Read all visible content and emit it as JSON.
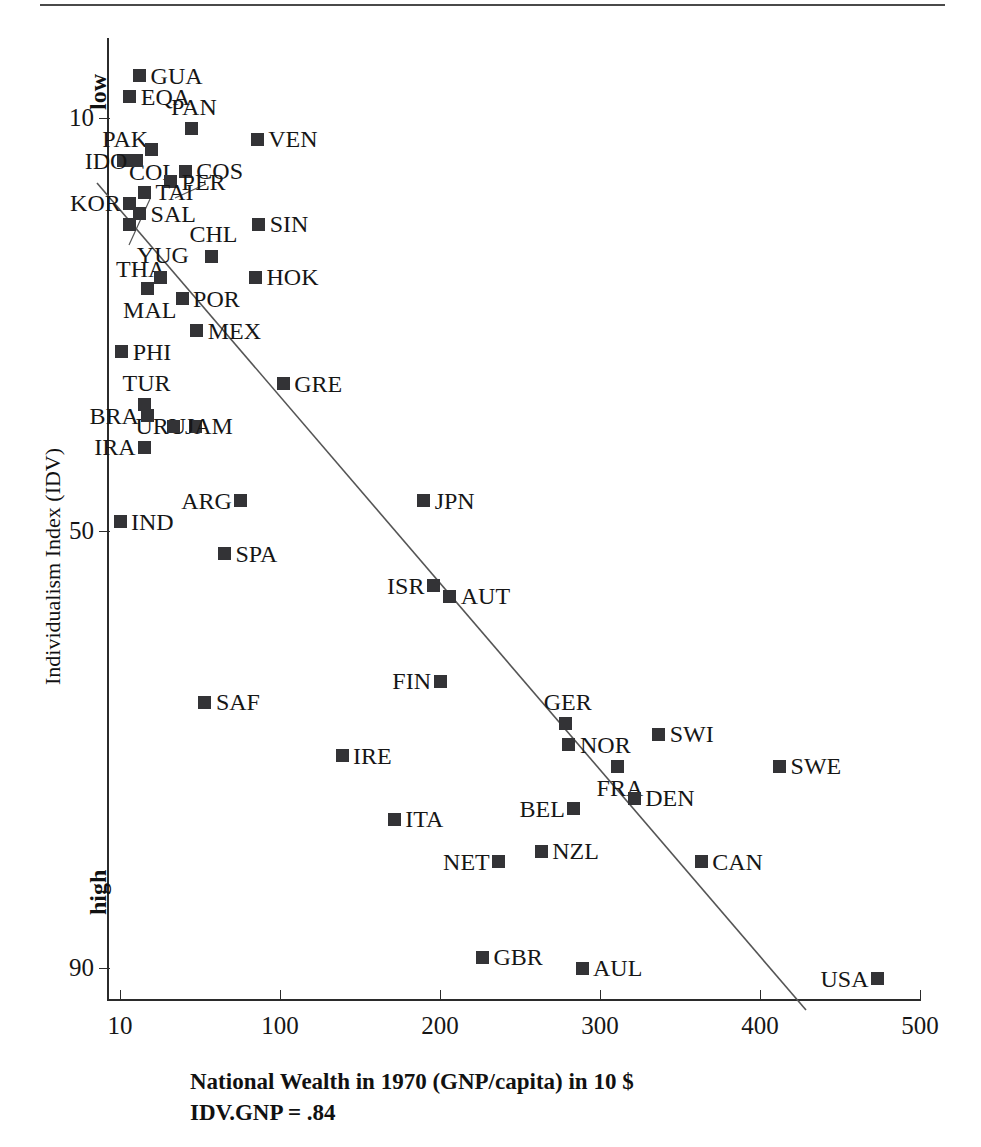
{
  "figure": {
    "xaxis_title_line1": "National Wealth in 1970 (GNP/capita) in 10 $",
    "xaxis_title_line2": "IDV.GNP = .84",
    "yaxis_title": "Individualism Index (IDV)",
    "y_low_label": "low",
    "y_high_label": "high",
    "marker_color": "#333336",
    "axis_color": "#2b2b2b",
    "line_color": "#555555"
  },
  "chart_data": {
    "type": "scatter",
    "title": "",
    "xlabel": "National Wealth in 1970 (GNP/capita) in 10 $",
    "ylabel": "Individualism Index (IDV)",
    "xlim": [
      0,
      520
    ],
    "ylim": [
      4,
      94
    ],
    "y_inverted": true,
    "grid": false,
    "legend": "none",
    "annotations": [
      "IDV.GNP = .84",
      "low",
      "high"
    ],
    "xticks": [
      10,
      100,
      200,
      300,
      400,
      500
    ],
    "yticks": [
      10,
      50,
      90
    ],
    "regression_line": {
      "x1": 12,
      "y1": 4.5,
      "x2": 427,
      "y2": 91.5,
      "correlation": 0.84
    },
    "points": [
      {
        "code": "GUA",
        "x": 22,
        "y": 6,
        "label_side": "right"
      },
      {
        "code": "EQA",
        "x": 16,
        "y": 8,
        "label_side": "right"
      },
      {
        "code": "PAN",
        "x": 54,
        "y": 11,
        "label_side": "above"
      },
      {
        "code": "VEN",
        "x": 94,
        "y": 12,
        "label_side": "right"
      },
      {
        "code": "PAK",
        "x": 12,
        "y": 14,
        "label_side": "above"
      },
      {
        "code": "COL",
        "x": 29,
        "y": 13,
        "label_side": "below"
      },
      {
        "code": "COS",
        "x": 50,
        "y": 15,
        "label_side": "right"
      },
      {
        "code": "IDO",
        "x": 20,
        "y": 14,
        "label_side": "left"
      },
      {
        "code": "PER",
        "x": 41,
        "y": 16,
        "label_side": "right"
      },
      {
        "code": "TAI",
        "x": 25,
        "y": 17,
        "label_side": "right"
      },
      {
        "code": "KOR",
        "x": 16,
        "y": 18,
        "label_side": "left"
      },
      {
        "code": "SIN",
        "x": 95,
        "y": 20,
        "label_side": "right"
      },
      {
        "code": "SAL",
        "x": 22,
        "y": 19,
        "label_side": "right"
      },
      {
        "code": "CHL",
        "x": 66,
        "y": 23,
        "label_side": "above"
      },
      {
        "code": "THA",
        "x": 16,
        "y": 20,
        "label_side": "leader"
      },
      {
        "code": "HOK",
        "x": 93,
        "y": 25,
        "label_side": "right"
      },
      {
        "code": "YUG",
        "x": 35,
        "y": 25,
        "label_side": "above"
      },
      {
        "code": "POR",
        "x": 48,
        "y": 27,
        "label_side": "right"
      },
      {
        "code": "MAL",
        "x": 27,
        "y": 26,
        "label_side": "below"
      },
      {
        "code": "MEX",
        "x": 57,
        "y": 30,
        "label_side": "right"
      },
      {
        "code": "PHI",
        "x": 11,
        "y": 32,
        "label_side": "right"
      },
      {
        "code": "GRE",
        "x": 110,
        "y": 35,
        "label_side": "right"
      },
      {
        "code": "TUR",
        "x": 25,
        "y": 37,
        "label_side": "above"
      },
      {
        "code": "URU",
        "x": 56,
        "y": 39,
        "label_side": "left"
      },
      {
        "code": "BRA",
        "x": 27,
        "y": 38,
        "label_side": "left"
      },
      {
        "code": "JAM",
        "x": 43,
        "y": 39,
        "label_side": "right"
      },
      {
        "code": "IRA",
        "x": 25,
        "y": 41,
        "label_side": "left"
      },
      {
        "code": "ARG",
        "x": 84,
        "y": 46,
        "label_side": "left"
      },
      {
        "code": "JPN",
        "x": 196,
        "y": 46,
        "label_side": "right"
      },
      {
        "code": "IND",
        "x": 10,
        "y": 48,
        "label_side": "right"
      },
      {
        "code": "SPA",
        "x": 74,
        "y": 51,
        "label_side": "right"
      },
      {
        "code": "ISR",
        "x": 202,
        "y": 54,
        "label_side": "left"
      },
      {
        "code": "AUT",
        "x": 212,
        "y": 55,
        "label_side": "right"
      },
      {
        "code": "FIN",
        "x": 206,
        "y": 63,
        "label_side": "left"
      },
      {
        "code": "SAF",
        "x": 62,
        "y": 65,
        "label_side": "right"
      },
      {
        "code": "GER",
        "x": 283,
        "y": 67,
        "label_side": "above"
      },
      {
        "code": "NOR",
        "x": 285,
        "y": 69,
        "label_side": "right"
      },
      {
        "code": "SWI",
        "x": 340,
        "y": 68,
        "label_side": "right"
      },
      {
        "code": "SWE",
        "x": 414,
        "y": 71,
        "label_side": "right"
      },
      {
        "code": "FRA",
        "x": 315,
        "y": 71,
        "label_side": "below"
      },
      {
        "code": "IRE",
        "x": 146,
        "y": 70,
        "label_side": "right"
      },
      {
        "code": "BEL",
        "x": 288,
        "y": 75,
        "label_side": "left"
      },
      {
        "code": "DEN",
        "x": 325,
        "y": 74,
        "label_side": "right"
      },
      {
        "code": "ITA",
        "x": 178,
        "y": 76,
        "label_side": "right"
      },
      {
        "code": "NZL",
        "x": 268,
        "y": 79,
        "label_side": "right"
      },
      {
        "code": "NET",
        "x": 242,
        "y": 80,
        "label_side": "left"
      },
      {
        "code": "CAN",
        "x": 366,
        "y": 80,
        "label_side": "right"
      },
      {
        "code": "GBR",
        "x": 232,
        "y": 89,
        "label_side": "right"
      },
      {
        "code": "AUL",
        "x": 293,
        "y": 90,
        "label_side": "right"
      },
      {
        "code": "USA",
        "x": 474,
        "y": 91,
        "label_side": "left"
      }
    ]
  },
  "axis_ticks": {
    "x": [
      {
        "label": "10",
        "px": 120
      },
      {
        "label": "100",
        "px": 280
      },
      {
        "label": "200",
        "px": 440
      },
      {
        "label": "300",
        "px": 600
      },
      {
        "label": "400",
        "px": 760
      },
      {
        "label": "500",
        "px": 920
      }
    ],
    "y": [
      {
        "label": "10",
        "py": 118
      },
      {
        "label": "50",
        "py": 531
      },
      {
        "label": "90",
        "py": 968
      }
    ]
  }
}
